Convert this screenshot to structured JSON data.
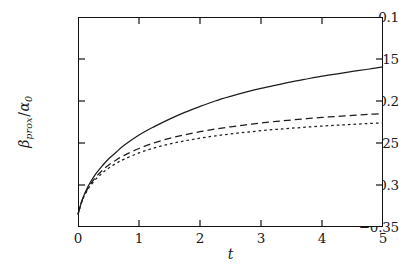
{
  "figure": {
    "background_color": "#ffffff",
    "foreground_color": "#111111"
  },
  "axes": {
    "x_label": "t",
    "y_label_main": "β",
    "y_label_sub": "prox",
    "y_label_slash": "/",
    "y_label_denom": "α",
    "y_label_denom_sub": "0",
    "x_ticks": [
      "0",
      "1",
      "2",
      "3",
      "4",
      "5"
    ],
    "y_ticks": [
      "−0.1",
      "−0.15",
      "−0.2",
      "−0.25",
      "−0.3",
      "−0.35"
    ]
  },
  "chart_data": {
    "type": "line",
    "title": "",
    "xlabel": "t",
    "ylabel": "beta_prox / alpha_0",
    "xlim": [
      0,
      5
    ],
    "ylim": [
      -0.35,
      -0.1
    ],
    "xticks": [
      0,
      1,
      2,
      3,
      4,
      5
    ],
    "yticks": [
      -0.35,
      -0.3,
      -0.25,
      -0.2,
      -0.15,
      -0.1
    ],
    "grid": false,
    "legend": "none",
    "x": [
      0,
      0.05,
      0.1,
      0.15,
      0.2,
      0.3,
      0.4,
      0.5,
      0.625,
      0.75,
      1,
      1.25,
      1.5,
      1.75,
      2,
      2.25,
      2.5,
      2.75,
      3,
      3.25,
      3.5,
      3.75,
      4,
      4.25,
      4.5,
      4.75,
      5
    ],
    "series": [
      {
        "name": "solid",
        "style": "solid",
        "values": [
          -0.335,
          -0.322,
          -0.312,
          -0.304,
          -0.297,
          -0.286,
          -0.277,
          -0.269,
          -0.261,
          -0.253,
          -0.2405,
          -0.2305,
          -0.2215,
          -0.2135,
          -0.2065,
          -0.2,
          -0.1945,
          -0.1895,
          -0.185,
          -0.181,
          -0.1772,
          -0.1738,
          -0.1705,
          -0.1676,
          -0.1648,
          -0.1622,
          -0.1595
        ]
      },
      {
        "name": "dashed",
        "style": "dashed",
        "values": [
          -0.335,
          -0.322,
          -0.3125,
          -0.3055,
          -0.2995,
          -0.29,
          -0.2825,
          -0.2765,
          -0.2702,
          -0.265,
          -0.2565,
          -0.2498,
          -0.2445,
          -0.2402,
          -0.2365,
          -0.2334,
          -0.2307,
          -0.2284,
          -0.2262,
          -0.2243,
          -0.2226,
          -0.2211,
          -0.2196,
          -0.2183,
          -0.2171,
          -0.216,
          -0.2149
        ]
      },
      {
        "name": "dotted",
        "style": "dotted",
        "values": [
          -0.335,
          -0.3225,
          -0.3135,
          -0.3068,
          -0.3012,
          -0.2924,
          -0.2856,
          -0.28,
          -0.2742,
          -0.2695,
          -0.2618,
          -0.2559,
          -0.2512,
          -0.2474,
          -0.2442,
          -0.2415,
          -0.2392,
          -0.2372,
          -0.2354,
          -0.2338,
          -0.2324,
          -0.2311,
          -0.2299,
          -0.2288,
          -0.2278,
          -0.2269,
          -0.226
        ]
      }
    ]
  }
}
